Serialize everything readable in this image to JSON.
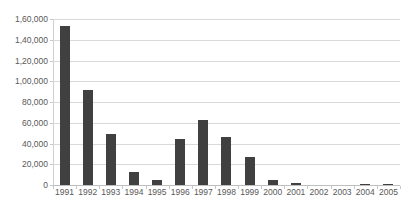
{
  "chart_data": {
    "type": "bar",
    "title": "",
    "xlabel": "",
    "ylabel": "",
    "categories": [
      "1991",
      "1992",
      "1993",
      "1994",
      "1995",
      "1996",
      "1997",
      "1998",
      "1999",
      "2000",
      "2001",
      "2002",
      "2003",
      "2004",
      "2005"
    ],
    "values": [
      153000,
      91500,
      49000,
      12500,
      5000,
      44500,
      62500,
      46000,
      27000,
      4500,
      1800,
      0,
      0,
      1000,
      1000
    ],
    "ylim": [
      0,
      160000
    ],
    "ytick_values": [
      0,
      20000,
      40000,
      60000,
      80000,
      100000,
      120000,
      140000,
      160000
    ],
    "ytick_labels": [
      "0",
      "20,000",
      "40,000",
      "60,000",
      "80,000",
      "1,00,000",
      "1,20,000",
      "1,40,000",
      "1,60,000"
    ],
    "grid": true,
    "legend": "none",
    "series": [
      {
        "name": "",
        "color": "#404040",
        "values": [
          153000,
          91500,
          49000,
          12500,
          5000,
          44500,
          62500,
          46000,
          27000,
          4500,
          1800,
          0,
          0,
          1000,
          1000
        ]
      }
    ],
    "colors": {
      "bar": "#404040",
      "gridline": "#d9d9d9",
      "axis": "#bfbfbf",
      "tick_text": "#595959",
      "background": "#ffffff"
    }
  }
}
